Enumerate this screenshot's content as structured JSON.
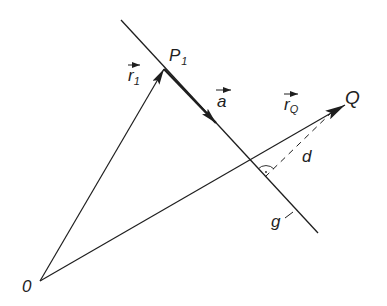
{
  "diagram": {
    "colors": {
      "ink": "#1e1e1e",
      "background": "#ffffff"
    },
    "points": {
      "origin": {
        "label": "0",
        "x": 40,
        "y": 281
      },
      "P1": {
        "label": "P",
        "subscript": "1",
        "x": 164,
        "y": 69
      },
      "a_tip": {
        "x": 216,
        "y": 123
      },
      "Q": {
        "label": "Q",
        "x": 345,
        "y": 105
      },
      "foot": {
        "x": 265,
        "y": 177
      }
    },
    "lines": {
      "g": {
        "label": "g",
        "x1": 121,
        "y1": 20,
        "x2": 318,
        "y2": 233
      }
    },
    "vectors": {
      "r1": {
        "label": "r",
        "subscript": "1"
      },
      "a": {
        "label": "a"
      },
      "rQ": {
        "label": "r",
        "subscript": "Q"
      }
    },
    "distance": {
      "label": "d"
    },
    "labels": {
      "origin": "0",
      "P1_main": "P",
      "P1_sub": "1",
      "Q": "Q",
      "r1_main": "r",
      "r1_sub": "1",
      "a": "a",
      "rQ_main": "r",
      "rQ_sub": "Q",
      "d": "d",
      "g": "g"
    }
  }
}
